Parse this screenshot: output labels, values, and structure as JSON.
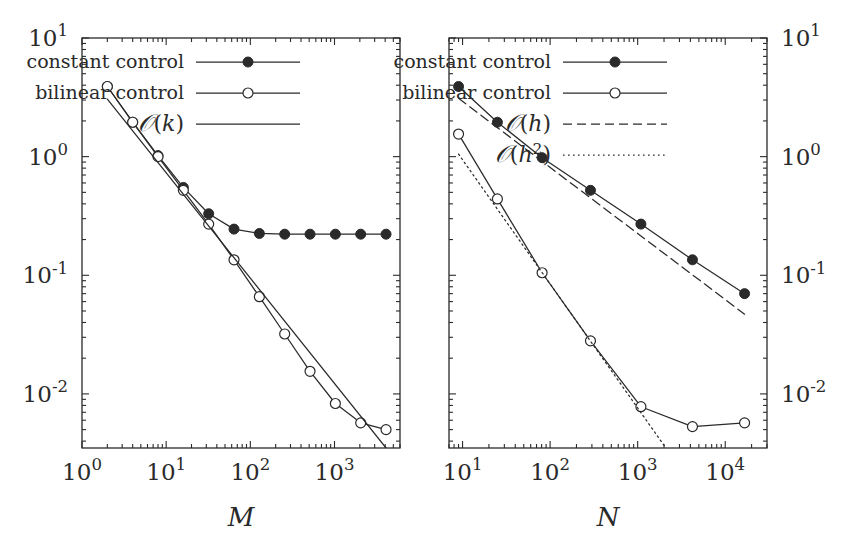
{
  "figure": {
    "background": "#ffffff",
    "ink": "#2a2a2a",
    "panels": 2
  },
  "chart_data": [
    {
      "id": "left-panel",
      "type": "line",
      "title": "",
      "xlabel": "M",
      "ylabel": "",
      "xscale": "log",
      "yscale": "log",
      "xlim": [
        1,
        6000
      ],
      "ylim": [
        0.0035,
        10
      ],
      "xticks": [
        1,
        10,
        100,
        1000
      ],
      "xticklabels": [
        "10^0",
        "10^1",
        "10^2",
        "10^3"
      ],
      "yticks": [
        10,
        1,
        0.1,
        0.01
      ],
      "yticklabels": [
        "10^1",
        "10^0",
        "10^-1",
        "10^-2"
      ],
      "ytick_side": "left",
      "grid": false,
      "legend_position": "top-right-inside",
      "series": [
        {
          "name": "constant control",
          "marker": "filled-circle",
          "linestyle": "solid",
          "x": [
            2,
            4,
            8,
            16,
            32,
            64,
            128,
            256,
            512,
            1024,
            2048,
            4096
          ],
          "y": [
            3.9,
            1.95,
            1.02,
            0.55,
            0.33,
            0.245,
            0.225,
            0.222,
            0.222,
            0.222,
            0.222,
            0.222
          ]
        },
        {
          "name": "bilinear control",
          "marker": "open-circle",
          "linestyle": "solid",
          "x": [
            2,
            4,
            8,
            16,
            32,
            64,
            128,
            256,
            512,
            1024,
            2048,
            4096
          ],
          "y": [
            3.9,
            1.95,
            1.0,
            0.52,
            0.27,
            0.135,
            0.066,
            0.032,
            0.0155,
            0.0083,
            0.0057,
            0.005
          ]
        },
        {
          "name": "O(k)",
          "marker": "none",
          "linestyle": "solid",
          "x": [
            2,
            4096
          ],
          "y": [
            3.05,
            0.0035
          ]
        }
      ]
    },
    {
      "id": "right-panel",
      "type": "line",
      "title": "",
      "xlabel": "N",
      "ylabel": "",
      "xscale": "log",
      "yscale": "log",
      "xlim": [
        7,
        30000
      ],
      "ylim": [
        0.0035,
        10
      ],
      "xticks": [
        10,
        100,
        1000,
        10000
      ],
      "xticklabels": [
        "10^1",
        "10^2",
        "10^3",
        "10^4"
      ],
      "yticks": [
        10,
        1,
        0.1,
        0.01
      ],
      "yticklabels": [
        "10^1",
        "10^0",
        "10^-1",
        "10^-2"
      ],
      "ytick_side": "right",
      "grid": false,
      "legend_position": "top-right-inside",
      "series": [
        {
          "name": "constant control",
          "marker": "filled-circle",
          "linestyle": "solid",
          "x": [
            9,
            25,
            81,
            289,
            1089,
            4225,
            16641
          ],
          "y": [
            3.9,
            1.95,
            0.98,
            0.52,
            0.27,
            0.135,
            0.07
          ]
        },
        {
          "name": "bilinear control",
          "marker": "open-circle",
          "linestyle": "solid",
          "x": [
            9,
            25,
            81,
            289,
            1089,
            4225,
            16641
          ],
          "y": [
            1.55,
            0.44,
            0.105,
            0.028,
            0.0078,
            0.0053,
            0.0057
          ]
        },
        {
          "name": "O(h)",
          "marker": "none",
          "linestyle": "dashed",
          "x": [
            9,
            16641
          ],
          "y": [
            3.1,
            0.047
          ]
        },
        {
          "name": "O(h^2)",
          "marker": "none",
          "linestyle": "dotted",
          "x": [
            9,
            2100
          ],
          "y": [
            1.05,
            0.0035
          ]
        }
      ]
    }
  ],
  "legends": {
    "left": {
      "items": [
        {
          "label": "constant control",
          "marker": "filled-circle",
          "linestyle": "solid"
        },
        {
          "label": "bilinear control",
          "marker": "open-circle",
          "linestyle": "solid"
        },
        {
          "label": "O(k)",
          "marker": "none",
          "linestyle": "solid"
        }
      ]
    },
    "right": {
      "items": [
        {
          "label": "constant control",
          "marker": "filled-circle",
          "linestyle": "solid"
        },
        {
          "label": "bilinear control",
          "marker": "open-circle",
          "linestyle": "solid"
        },
        {
          "label": "O(h)",
          "marker": "none",
          "linestyle": "dashed"
        },
        {
          "label": "O(h^2)",
          "marker": "none",
          "linestyle": "dotted"
        }
      ]
    }
  },
  "axis_labels": {
    "left_x": "M",
    "right_x": "N"
  }
}
